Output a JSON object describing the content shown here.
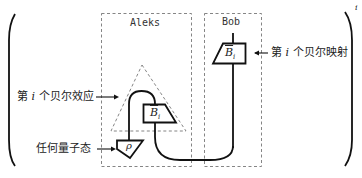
{
  "diagram": {
    "parties": {
      "left": {
        "name": "Aleks"
      },
      "right": {
        "name": "Bob"
      }
    },
    "boxes": {
      "bob_map": {
        "symbol": "B",
        "hat": "^",
        "subscript": "i"
      },
      "aleks_map": {
        "symbol": "B",
        "hat": "^",
        "subscript": "i"
      },
      "state": {
        "symbol": "ρ"
      }
    },
    "annotations": {
      "bell_map": {
        "prefix": "第",
        "index": "i",
        "suffix": "个贝尔映射"
      },
      "bell_effect": {
        "prefix": "第",
        "index": "i",
        "suffix": "个贝尔效应"
      },
      "any_state": {
        "text": "任何量子态"
      }
    },
    "superscript": "i",
    "colors": {
      "line": "#111111",
      "dashed": "#777777",
      "text": "#222222"
    }
  }
}
